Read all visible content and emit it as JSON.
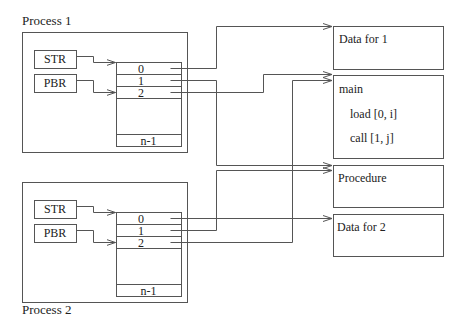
{
  "process1": {
    "title": "Process 1",
    "registers": [
      {
        "label": "STR"
      },
      {
        "label": "PBR"
      }
    ],
    "table": {
      "rows": [
        "0",
        "1",
        "2"
      ],
      "last_row": "n-1"
    }
  },
  "process2": {
    "title": "Process 2",
    "registers": [
      {
        "label": "STR"
      },
      {
        "label": "PBR"
      }
    ],
    "table": {
      "rows": [
        "0",
        "1",
        "2"
      ],
      "last_row": "n-1"
    }
  },
  "segments": {
    "data1": {
      "title": "Data for 1"
    },
    "main": {
      "title": "main",
      "lines": [
        "load [0, i]",
        "call [1, j]"
      ]
    },
    "procedure": {
      "title": "Procedure"
    },
    "data2": {
      "title": "Data for 2"
    }
  },
  "colors": {
    "line": "#555555",
    "text": "#222222"
  }
}
